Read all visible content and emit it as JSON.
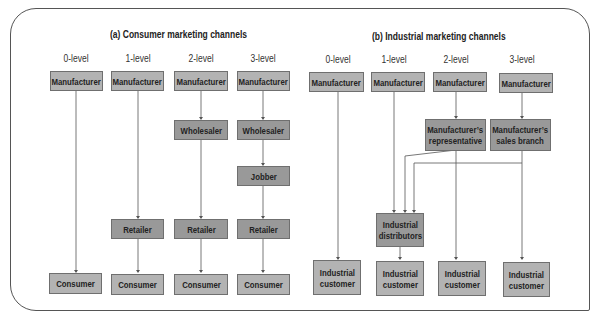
{
  "consumer": {
    "title": "(a) Consumer marketing channels",
    "levels": [
      "0-level",
      "1-level",
      "2-level",
      "3-level"
    ],
    "manufacturer": "Manufacturer",
    "wholesaler": "Wholesaler",
    "jobber": "Jobber",
    "retailer": "Retailer",
    "consumer": "Consumer"
  },
  "industrial": {
    "title": "(b) Industrial marketing channels",
    "levels": [
      "0-level",
      "1-level",
      "2-level",
      "3-level"
    ],
    "manufacturer": "Manufacturer",
    "rep": "Manufacturer’s representative",
    "rep_line1": "Manufacturer’s",
    "rep_line2": "representative",
    "branch_line1": "Manufacturer’s",
    "branch_line2": "sales branch",
    "dist_line1": "Industrial",
    "dist_line2": "distributors",
    "cust_line1": "Industrial",
    "cust_line2": "customer"
  },
  "colors": {
    "endpoint_box": "#b3b3b3",
    "intermediary_box": "#999999",
    "line": "#555555"
  }
}
